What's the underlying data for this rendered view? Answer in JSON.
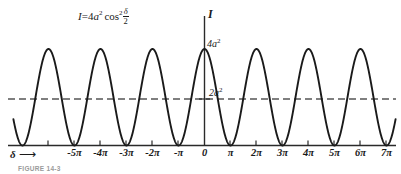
{
  "figure": {
    "equation": {
      "lhs": "I",
      "equals": "=",
      "coefficient": "4",
      "amplitude_symbol": "a",
      "amplitude_exponent": "2",
      "function": "cos",
      "function_exponent": "2",
      "argument_numerator": "δ",
      "argument_denominator": "2",
      "plain": "I = 4a² cos² δ/2"
    },
    "y_axis_label": "I",
    "x_axis_variable": "δ",
    "x_axis_arrow": "⟶",
    "peak_label": "4a²",
    "peak_label_base": "4a",
    "peak_label_exp": "2",
    "mean_label": "2a²",
    "mean_label_base": "2a",
    "mean_label_exp": "2",
    "caption": "FIGURE 14-3"
  },
  "chart_data": {
    "type": "line",
    "xlabel": "δ",
    "ylabel": "I",
    "grid": false,
    "legend": null,
    "xlim": [
      -7.6,
      7.6
    ],
    "ylim": [
      0,
      4
    ],
    "x_unit": "π",
    "y_unit": "a²",
    "xtick_values": [
      -5,
      -4,
      -3,
      -2,
      -1,
      0,
      1,
      2,
      3,
      4,
      5,
      6,
      7
    ],
    "xtick_labels": [
      "-5π",
      "-4π",
      "-3π",
      "-2π",
      "-π",
      "0",
      "π",
      "2π",
      "3π",
      "4π",
      "5π",
      "6π",
      "7π"
    ],
    "ytick_values": [
      2,
      4
    ],
    "ytick_labels": [
      "2a²",
      "4a²"
    ],
    "reference_lines": [
      {
        "name": "mean-intensity",
        "orientation": "horizontal",
        "value": 2,
        "label": "2a²",
        "style": "dashed"
      }
    ],
    "series": [
      {
        "name": "intensity",
        "formula": "I = 4a^2 cos^2(delta/2)",
        "amplitude": 4,
        "period_in_pi": 2,
        "maxima_x_in_pi": [
          -6,
          -4,
          -2,
          0,
          2,
          4,
          6
        ],
        "maxima_y": [
          4,
          4,
          4,
          4,
          4,
          4,
          4
        ],
        "minima_x_in_pi": [
          -7,
          -5,
          -3,
          -1,
          1,
          3,
          5,
          7
        ],
        "minima_y": [
          0,
          0,
          0,
          0,
          0,
          0,
          0,
          0
        ],
        "mean_value": 2
      }
    ]
  }
}
